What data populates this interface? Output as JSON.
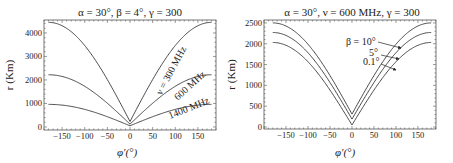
{
  "chart_data": [
    {
      "type": "line",
      "title": "α = 30°,  β = 4°,  γ = 300",
      "xlabel": "φ′(°)",
      "ylabel": "r (Km)",
      "xlim": [
        -190,
        190
      ],
      "ylim": [
        -130,
        4550
      ],
      "xticks": [
        -150,
        -100,
        -50,
        0,
        50,
        100,
        150
      ],
      "yticks": [
        0,
        1000,
        2000,
        3000,
        4000
      ],
      "grid": false,
      "series": [
        {
          "name": "ν = 300 MHz",
          "min": 230,
          "max": 4450,
          "label": "ν = 300 MHz"
        },
        {
          "name": "600 MHz",
          "min": 120,
          "max": 2220,
          "label": "600 MHz"
        },
        {
          "name": "1400 MHz",
          "min": 50,
          "max": 960,
          "label": "1400 MHz"
        }
      ],
      "x": [
        -180,
        -150,
        -120,
        -90,
        -60,
        -30,
        -15,
        0,
        15,
        30,
        60,
        90,
        120,
        150,
        180
      ],
      "values_approx": {
        "ν = 300 MHz": [
          4450,
          4300,
          3880,
          3210,
          2340,
          1320,
          780,
          230,
          780,
          1320,
          2340,
          3210,
          3880,
          4300,
          4450
        ],
        "600 MHz": [
          2220,
          2150,
          1940,
          1610,
          1170,
          660,
          390,
          120,
          390,
          660,
          1170,
          1610,
          1940,
          2150,
          2220
        ],
        "1400 MHz": [
          960,
          930,
          840,
          700,
          510,
          290,
          170,
          50,
          170,
          290,
          510,
          700,
          840,
          930,
          960
        ]
      }
    },
    {
      "type": "line",
      "title": "α = 30°,  ν = 600 MHz,  γ = 300",
      "xlabel": "φ′(°)",
      "ylabel": "r (Km)",
      "xlim": [
        -200,
        191
      ],
      "ylim": [
        -48,
        2570
      ],
      "xticks": [
        -150,
        -100,
        -50,
        0,
        50,
        100,
        150
      ],
      "yticks": [
        0,
        500,
        1000,
        1500,
        2000,
        2500
      ],
      "grid": false,
      "series": [
        {
          "name": "β = 10°",
          "min": 310,
          "max": 2500,
          "label": "β = 10°"
        },
        {
          "name": "5°",
          "min": 190,
          "max": 2270,
          "label": "5°"
        },
        {
          "name": "0.1°",
          "min": 50,
          "max": 2030,
          "label": "0.1°"
        }
      ],
      "x": [
        -180,
        -150,
        -120,
        -90,
        -60,
        -30,
        -15,
        0,
        15,
        30,
        60,
        90,
        120,
        150,
        180
      ],
      "values_approx": {
        "β = 10°": [
          2500,
          2420,
          2200,
          1860,
          1400,
          880,
          600,
          310,
          600,
          880,
          1400,
          1860,
          2200,
          2420,
          2500
        ],
        "5°": [
          2270,
          2190,
          1990,
          1660,
          1230,
          730,
          460,
          190,
          460,
          730,
          1230,
          1660,
          1990,
          2190,
          2270
        ],
        "0.1°": [
          2030,
          1960,
          1760,
          1450,
          1040,
          560,
          310,
          50,
          310,
          560,
          1040,
          1450,
          1760,
          1960,
          2030
        ]
      }
    }
  ]
}
